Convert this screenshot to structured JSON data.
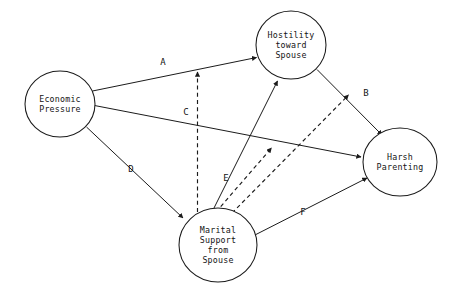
{
  "diagram": {
    "type": "path-diagram",
    "title": "",
    "background_color": "#ffffff",
    "line_color": "#1b1b1b",
    "text_color": "#141414",
    "nodes": [
      {
        "id": "economic-pressure",
        "lines": [
          "Economic",
          "Pressure"
        ],
        "line1": "Economic",
        "line2": "Pressure",
        "cx": 60,
        "cy": 104,
        "rx": 35,
        "ry": 33
      },
      {
        "id": "hostility-toward-spouse",
        "lines": [
          "Hostility",
          "toward",
          "Spouse"
        ],
        "line1": "Hostility",
        "line2": "toward",
        "line3": "Spouse",
        "cx": 291,
        "cy": 45,
        "rx": 35,
        "ry": 34
      },
      {
        "id": "harsh-parenting",
        "lines": [
          "Harsh",
          "Parenting"
        ],
        "line1": "Harsh",
        "line2": "Parenting",
        "cx": 400,
        "cy": 162,
        "rx": 37,
        "ry": 34
      },
      {
        "id": "marital-support-from-spouse",
        "lines": [
          "Marital",
          "Support",
          "from",
          "Spouse"
        ],
        "line1": "Marital",
        "line2": "Support",
        "line3": "from",
        "line4": "Spouse",
        "cx": 218,
        "cy": 245,
        "rx": 39,
        "ry": 37
      }
    ],
    "edges": [
      {
        "id": "path-a",
        "label": "A",
        "label_x": 163,
        "label_y": 65,
        "style": "solid",
        "from": "economic-pressure",
        "to": "hostility-toward-spouse"
      },
      {
        "id": "path-b",
        "label": "B",
        "label_x": 366,
        "label_y": 96,
        "style": "solid",
        "from": "hostility-toward-spouse",
        "to": "harsh-parenting"
      },
      {
        "id": "path-c",
        "label": "C",
        "label_x": 186,
        "label_y": 115,
        "style": "solid",
        "from": "economic-pressure",
        "to": "harsh-parenting"
      },
      {
        "id": "path-d",
        "label": "D",
        "label_x": 131,
        "label_y": 172,
        "style": "solid",
        "from": "economic-pressure",
        "to": "marital-support-from-spouse"
      },
      {
        "id": "path-e",
        "label": "E",
        "label_x": 226,
        "label_y": 181,
        "style": "solid",
        "from": "marital-support-from-spouse",
        "to": "hostility-toward-spouse"
      },
      {
        "id": "path-f",
        "label": "F",
        "label_x": 303,
        "label_y": 215,
        "style": "solid",
        "from": "marital-support-from-spouse",
        "to": "harsh-parenting"
      },
      {
        "id": "moderation-on-path-a",
        "label": "",
        "style": "dashed",
        "from": "marital-support-from-spouse",
        "to": "path-a"
      },
      {
        "id": "moderation-on-path-c",
        "label": "",
        "style": "dashed",
        "from": "marital-support-from-spouse",
        "to": "path-c"
      },
      {
        "id": "moderation-on-path-b",
        "label": "",
        "style": "dashed",
        "from": "marital-support-from-spouse",
        "to": "path-b"
      }
    ]
  }
}
